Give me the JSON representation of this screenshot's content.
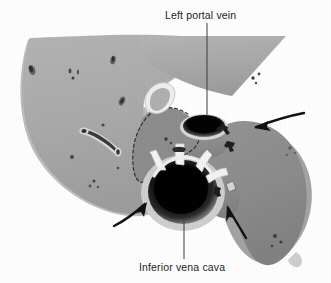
{
  "figure": {
    "kind": "anatomical-illustration",
    "background_color": "#ffffff",
    "labels": [
      {
        "id": "left-portal-vein",
        "text": "Left portal vein",
        "x": 165,
        "y": 9,
        "leader": {
          "from_x": 207,
          "from_y": 23,
          "to_x": 207,
          "to_y": 117
        }
      },
      {
        "id": "inferior-vena-cava",
        "text": "Inferior vena cava",
        "x": 139,
        "y": 261,
        "leader": {
          "from_x": 184,
          "from_y": 259,
          "to_x": 184,
          "to_y": 221
        }
      }
    ],
    "structures": [
      {
        "id": "left-lobe",
        "name": "left-hepatic-lobe",
        "fill": "#a9a9a9"
      },
      {
        "id": "right-lobe",
        "name": "right-hepatic-lobe",
        "fill": "#8b8b8b"
      },
      {
        "id": "caudate-lobe",
        "name": "caudate-lobe",
        "fill": "#8d8d8d",
        "outline": "dashed"
      },
      {
        "id": "portal-vein",
        "name": "left-portal-vein-lumen",
        "fill": "#0a0a0a"
      },
      {
        "id": "ivc",
        "name": "inferior-vena-cava-lumen",
        "fill": "#050505"
      },
      {
        "id": "hepatic-veins",
        "name": "hepatic-vein-branches",
        "fill": "#f2f2f2"
      },
      {
        "id": "fissure",
        "name": "ligamentum-venosum-fissure",
        "fill": "#f0f0f0"
      }
    ],
    "arrows": [
      {
        "id": "arrow-upper-right",
        "direction": "left-down",
        "tip_x": 229,
        "tip_y": 126
      },
      {
        "id": "arrow-lower-left",
        "direction": "up-right",
        "tip_x": 150,
        "tip_y": 201
      },
      {
        "id": "arrow-lower-right",
        "direction": "up-left",
        "tip_x": 228,
        "tip_y": 200
      },
      {
        "id": "arrow-right-margin",
        "direction": "left",
        "tip_x": 246,
        "tip_y": 124
      }
    ],
    "palette": {
      "ink": "#1d1d1d",
      "left_lobe": "#a9a9a9",
      "right_lobe": "#8b8b8b",
      "caudate": "#8d8d8d",
      "vessel_dark": "#0a0a0a",
      "vessel_rim": "#f2f2f2",
      "background": "#ffffff"
    }
  }
}
